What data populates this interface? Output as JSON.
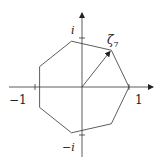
{
  "diagram": {
    "labels": {
      "i": "i",
      "neg_i": "−i",
      "one": "1",
      "neg_one": "−1",
      "zeta": "ζ",
      "zeta_sub": "7"
    },
    "colors": {
      "stroke": "#333333",
      "background": "#ffffff"
    },
    "heptagon": {
      "vertices": 7,
      "center": [
        82,
        87
      ],
      "radius": 47
    }
  }
}
